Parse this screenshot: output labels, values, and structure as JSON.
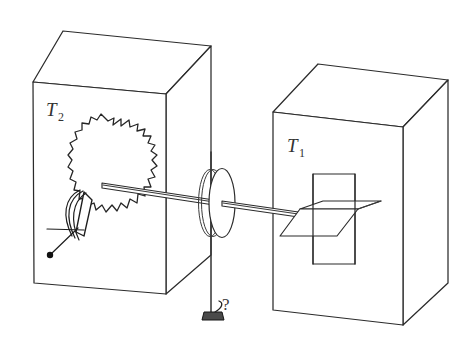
{
  "figure": {
    "background_color": "#ffffff",
    "line_color": "#2b2b2b",
    "width": 476,
    "height": 345
  },
  "labels": {
    "left_box": {
      "symbol": "T",
      "subscript": "2",
      "full": "T2"
    },
    "right_box": {
      "symbol": "T",
      "subscript": "1",
      "full": "T1"
    },
    "unknown_weight": "?"
  },
  "components": [
    {
      "name": "left-heat-bath-box",
      "label": "T2",
      "contains": "ratchet-wheel-and-pawl"
    },
    {
      "name": "right-heat-bath-box",
      "label": "T1",
      "contains": "paddle-vanes"
    },
    {
      "name": "ratchet-wheel",
      "teeth": 22
    },
    {
      "name": "pawl",
      "description": "spring-loaded pawl with pivot"
    },
    {
      "name": "axle-shaft",
      "description": "horizontal shaft connecting ratchet to paddle"
    },
    {
      "name": "pulley-disk",
      "description": "disk with string wound around it"
    },
    {
      "name": "hanging-weight",
      "label": "?"
    }
  ]
}
